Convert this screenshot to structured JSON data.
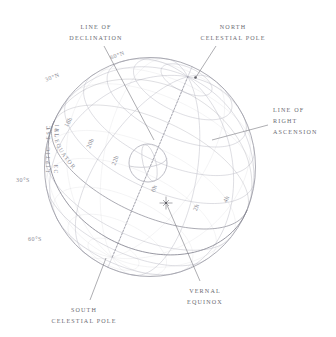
{
  "figure": {
    "background_color": "#ffffff",
    "grid_color": "#b9b9c2",
    "outline_color": "#9b9ba5",
    "label_color": "#6a6a72",
    "sphere_label_color": "#8a8a93",
    "leader_color": "#5f5f66"
  },
  "callouts": [
    {
      "name": "line-of-declination",
      "lines": [
        "LINE OF",
        "DECLINATION"
      ],
      "anchor": "middle",
      "x": 96,
      "y": 29,
      "line_height": 11,
      "leader": {
        "x1": 104,
        "y1": 46,
        "x2": 154,
        "y2": 140
      }
    },
    {
      "name": "north-celestial-pole",
      "lines": [
        "NORTH",
        "CELESTIAL POLE"
      ],
      "anchor": "middle",
      "x": 233,
      "y": 29,
      "line_height": 11,
      "leader": {
        "x1": 216,
        "y1": 46,
        "x2": 196,
        "y2": 77
      }
    },
    {
      "name": "line-of-right-ascension",
      "lines": [
        "LINE OF",
        "RIGHT",
        "ASCENSION"
      ],
      "anchor": "start",
      "x": 273,
      "y": 112,
      "line_height": 11,
      "leader": {
        "x1": 268,
        "y1": 125,
        "x2": 212,
        "y2": 140
      }
    },
    {
      "name": "south-celestial-pole",
      "lines": [
        "SOUTH",
        "CELESTIAL POLE"
      ],
      "anchor": "middle",
      "x": 84,
      "y": 312,
      "line_height": 11,
      "leader": {
        "x1": 90,
        "y1": 300,
        "x2": 106,
        "y2": 258
      }
    },
    {
      "name": "vernal-equinox",
      "lines": [
        "VERNAL",
        "EQUINOX"
      ],
      "anchor": "middle",
      "x": 205,
      "y": 293,
      "line_height": 11,
      "leader": {
        "x1": 200,
        "y1": 281,
        "x2": 167,
        "y2": 205
      }
    }
  ],
  "declination_labels": [
    {
      "name": "dec-60n",
      "text": "60°N",
      "x": 118,
      "y": 57,
      "rotate": -20
    },
    {
      "name": "dec-30n",
      "text": "30°N",
      "x": 53,
      "y": 79,
      "rotate": -22
    },
    {
      "name": "dec-30s",
      "text": "30°S",
      "x": 23,
      "y": 182,
      "rotate": 0
    },
    {
      "name": "dec-60s",
      "text": "60°S",
      "x": 35,
      "y": 241,
      "rotate": 0
    }
  ],
  "hour_labels": [
    {
      "name": "ra-18h",
      "text": "18h",
      "x": 70,
      "y": 123,
      "rotate": -62
    },
    {
      "name": "ra-20h",
      "text": "20h",
      "x": 92,
      "y": 144,
      "rotate": -66
    },
    {
      "name": "ra-22h",
      "text": "22h",
      "x": 117,
      "y": 161,
      "rotate": -70
    },
    {
      "name": "ra-0h",
      "text": "0h",
      "x": 156,
      "y": 189,
      "rotate": -74
    },
    {
      "name": "ra-2h",
      "text": "2h",
      "x": 198,
      "y": 208,
      "rotate": -70
    },
    {
      "name": "ra-4h",
      "text": "4h",
      "x": 228,
      "y": 200,
      "rotate": -64
    }
  ],
  "curve_labels": [
    {
      "name": "celestial-equator-label",
      "text": "CELESTIAL EQUATOR",
      "path_id": "equator-label-path",
      "offset": "11%"
    },
    {
      "name": "ecliptic-label",
      "text": "ECLIPTIC",
      "path_id": "ecliptic-label-path",
      "offset": "50%"
    }
  ],
  "markers": [
    {
      "name": "vernal-equinox-marker",
      "x": 166,
      "y": 203,
      "type": "star"
    },
    {
      "name": "north-celestial-pole-marker",
      "x": 195.5,
      "y": 77.5,
      "type": "dot"
    }
  ],
  "earth_symbol": {
    "name": "earth-globe-symbol",
    "cx": 148,
    "cy": 163,
    "r": 19
  },
  "sphere": {
    "cx": 150,
    "cy": 167,
    "rx": 105.5,
    "ry": 109.5,
    "pole_tilt_deg": 23.5,
    "declination_rings": [
      75,
      60,
      45,
      30,
      15,
      0,
      -15,
      -30,
      -45,
      -60,
      -75
    ],
    "ra_hours": [
      0,
      2,
      4,
      6,
      8,
      10,
      12,
      14,
      16,
      18,
      20,
      22
    ]
  }
}
